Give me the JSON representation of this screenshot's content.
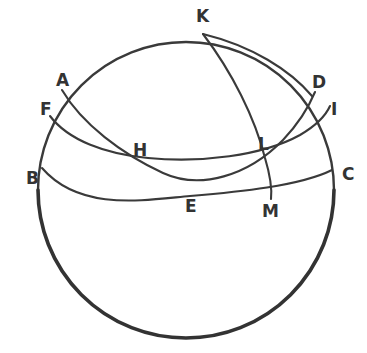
{
  "figure": {
    "type": "geometric-diagram",
    "background_color": "#ffffff",
    "stroke_color": "#3a3a3a",
    "label_color": "#333333",
    "width": 367,
    "height": 353
  },
  "sphere": {
    "name": "sphere-outline",
    "center_x": 186,
    "center_y": 190,
    "radius": 148
  },
  "labels": [
    {
      "id": "K",
      "text": "K",
      "x": 196,
      "y": 8
    },
    {
      "id": "A",
      "text": "A",
      "x": 56,
      "y": 72
    },
    {
      "id": "D",
      "text": "D",
      "x": 312,
      "y": 74
    },
    {
      "id": "F",
      "text": "F",
      "x": 40,
      "y": 101
    },
    {
      "id": "I",
      "text": "I",
      "x": 331,
      "y": 101
    },
    {
      "id": "L",
      "text": "L",
      "x": 258,
      "y": 136
    },
    {
      "id": "H",
      "text": "H",
      "x": 133,
      "y": 142
    },
    {
      "id": "B",
      "text": "B",
      "x": 26,
      "y": 170
    },
    {
      "id": "C",
      "text": "C",
      "x": 342,
      "y": 166
    },
    {
      "id": "E",
      "text": "E",
      "x": 185,
      "y": 198
    },
    {
      "id": "M",
      "text": "M",
      "x": 262,
      "y": 203
    }
  ],
  "arcs": [
    {
      "id": "limb-upper",
      "name": "sphere-limb-upper",
      "description": "upper portion of the bounding circle of the sphere",
      "weight": "normal"
    },
    {
      "id": "limb-lower",
      "name": "sphere-limb-lower",
      "description": "lower portion of the bounding circle, drawn heavier",
      "weight": "heavy"
    },
    {
      "id": "arc-BEC",
      "name": "great-circle-B-E-C",
      "description": "arc from B through E to C, sagging downward (horizon circle)",
      "endpoints": [
        "B",
        "C"
      ],
      "through": [
        "E"
      ]
    },
    {
      "id": "arc-FHLI",
      "name": "great-circle-F-H-L-I",
      "description": "arc from F through H and L to I",
      "endpoints": [
        "F",
        "I"
      ],
      "through": [
        "H",
        "L"
      ]
    },
    {
      "id": "arc-AED",
      "name": "great-circle-A-E-D",
      "description": "arc from A descending through H region and E up to D",
      "endpoints": [
        "A",
        "D"
      ],
      "through": [
        "E"
      ]
    },
    {
      "id": "arc-KLM",
      "name": "great-circle-K-L-M",
      "description": "meridian arc from K at the top down through L to M",
      "endpoints": [
        "K",
        "M"
      ],
      "through": [
        "L"
      ]
    },
    {
      "id": "arc-KD",
      "name": "great-circle-K-D",
      "description": "arc from K sweeping right and down to D",
      "endpoints": [
        "K",
        "D"
      ]
    }
  ]
}
